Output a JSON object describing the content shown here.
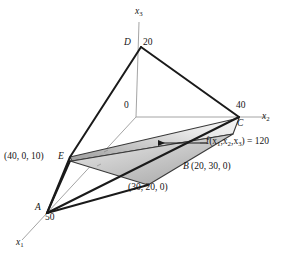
{
  "figure": {
    "title": "",
    "type": "3d-geometry-diagram",
    "axes": [
      {
        "name": "x3",
        "base": "x",
        "subscript": "3",
        "label": "x_3"
      },
      {
        "name": "x2",
        "base": "x",
        "subscript": "2",
        "label": "x_2"
      },
      {
        "name": "x1",
        "base": "x",
        "subscript": "1",
        "label": "x_1"
      }
    ],
    "origin_label": "0",
    "vertices": [
      {
        "id": "D",
        "letter": "D",
        "value_label": "20",
        "coords": null
      },
      {
        "id": "C",
        "letter": "C",
        "value_label": "40",
        "coords": null
      },
      {
        "id": "A",
        "letter": "A",
        "value_label": "50",
        "coords": null
      },
      {
        "id": "E",
        "letter": "E",
        "value_label": "",
        "coords": "(40, 0, 10)"
      },
      {
        "id": "B",
        "letter": "B",
        "value_label": "",
        "coords": "(20, 30, 0)"
      }
    ],
    "point_labels": [
      {
        "id": "E-coords",
        "text": "(40, 0, 10)"
      },
      {
        "id": "E-letter",
        "text": "E"
      },
      {
        "id": "B-letter",
        "text": "B"
      },
      {
        "id": "B-coords",
        "text": "(20, 30, 0)"
      },
      {
        "id": "point-30-20-0",
        "text": "(30, 20, 0)"
      },
      {
        "id": "D-letter",
        "text": "D"
      },
      {
        "id": "D-value",
        "text": "20"
      },
      {
        "id": "C-value",
        "text": "40"
      },
      {
        "id": "C-letter",
        "text": "C"
      },
      {
        "id": "A-letter",
        "text": "A"
      },
      {
        "id": "A-value",
        "text": "50"
      },
      {
        "id": "origin",
        "text": "0"
      }
    ],
    "annotation": {
      "function_prefix": "f(",
      "var1": "x",
      "var1_sub": "1",
      "sep1": ",",
      "var2": "x",
      "var2_sub": "2",
      "sep2": ",",
      "var3": "x",
      "var3_sub": "3",
      "function_suffix": ") = 120",
      "full_text": "f(x1, x2, x3) = 120",
      "value": "120"
    },
    "colors": {
      "line": "#1a1a1a",
      "thin_line": "#9a9a9a",
      "plane_light": "#f2f2f2",
      "plane_mid": "#cfcfcf",
      "plane_dark": "#9c9c9c",
      "plane_edge": "#3a3a3a",
      "background": "#ffffff",
      "text": "#141414"
    }
  }
}
